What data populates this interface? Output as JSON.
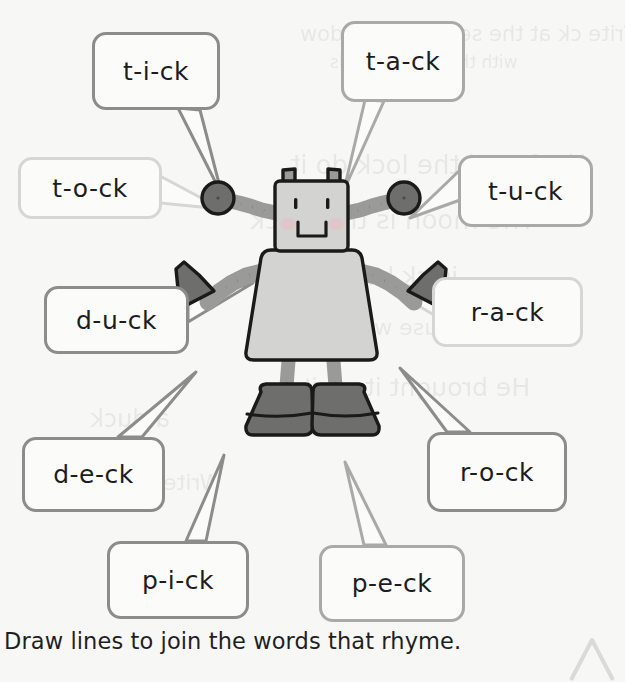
{
  "page": {
    "background_color": "#f7f7f6",
    "instruction": "Draw lines to join the words that rhyme.",
    "corner_mark": "chevron-up-outline"
  },
  "illustration": {
    "name": "robot",
    "description": "Cartoon grey robot with two antennae, segmented arms raised, ball hand and cone hand on each side, and large dark boots",
    "colors": {
      "body_fill": "#d3d3d2",
      "limb_fill": "#9a9a99",
      "dark_part_fill": "#6e6e6d",
      "outline": "#1a1a1a",
      "cheek": "#e3c3c6"
    }
  },
  "bubbles": [
    {
      "id": "bubble-t-i-ck",
      "text": "t-i-ck",
      "tone": "dark",
      "x": 92,
      "y": 32,
      "w": 128,
      "h": 78,
      "tail": "down-right"
    },
    {
      "id": "bubble-t-a-ck",
      "text": "t-a-ck",
      "tone": "mid",
      "x": 341,
      "y": 21,
      "w": 124,
      "h": 81,
      "tail": "down-left"
    },
    {
      "id": "bubble-t-o-ck",
      "text": "t-o-ck",
      "tone": "faint",
      "x": 18,
      "y": 157,
      "w": 144,
      "h": 62,
      "tail": "right"
    },
    {
      "id": "bubble-t-u-ck",
      "text": "t-u-ck",
      "tone": "mid",
      "x": 458,
      "y": 155,
      "w": 135,
      "h": 72,
      "tail": "left"
    },
    {
      "id": "bubble-d-u-ck",
      "text": "d-u-ck",
      "tone": "dark",
      "x": 44,
      "y": 286,
      "w": 145,
      "h": 68,
      "tail": "right"
    },
    {
      "id": "bubble-r-a-ck",
      "text": "r-a-ck",
      "tone": "faint",
      "x": 432,
      "y": 277,
      "w": 151,
      "h": 70,
      "tail": "left"
    },
    {
      "id": "bubble-d-e-ck",
      "text": "d-e-ck",
      "tone": "dark",
      "x": 22,
      "y": 437,
      "w": 143,
      "h": 75,
      "tail": "up-right"
    },
    {
      "id": "bubble-r-o-ck",
      "text": "r-o-ck",
      "tone": "dark",
      "x": 427,
      "y": 432,
      "w": 140,
      "h": 80,
      "tail": "up-left"
    },
    {
      "id": "bubble-p-i-ck",
      "text": "p-i-ck",
      "tone": "dark",
      "x": 107,
      "y": 541,
      "w": 142,
      "h": 78,
      "tail": "up-right"
    },
    {
      "id": "bubble-p-e-ck",
      "text": "p-e-ck",
      "tone": "mid",
      "x": 319,
      "y": 545,
      "w": 146,
      "h": 77,
      "tail": "up-left"
    }
  ],
  "showthrough_text": [
    {
      "text": "Write ck at the sentence window",
      "x": 300,
      "y": 22,
      "size": 21
    },
    {
      "text": "with the given sounds",
      "x": 330,
      "y": 52,
      "size": 17
    },
    {
      "text": "He found the lock  do it",
      "x": 290,
      "y": 150,
      "size": 26
    },
    {
      "text": "The moon is the clock",
      "x": 250,
      "y": 205,
      "size": 26
    },
    {
      "text": "is ck  back in the",
      "x": 255,
      "y": 262,
      "size": 25
    },
    {
      "text": "The mouse was sick",
      "x": 300,
      "y": 315,
      "size": 22
    },
    {
      "text": "He brought it  on it so",
      "x": 265,
      "y": 373,
      "size": 25
    },
    {
      "text": "a duck",
      "x": 90,
      "y": 405,
      "size": 24
    },
    {
      "text": "Write the",
      "x": 120,
      "y": 470,
      "size": 22
    }
  ]
}
